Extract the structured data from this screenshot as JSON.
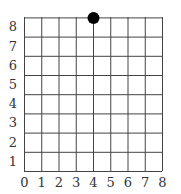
{
  "chart_data": {
    "type": "scatter",
    "title": "",
    "xlabel": "",
    "ylabel": "",
    "xlim": [
      0,
      8
    ],
    "ylim": [
      0,
      8
    ],
    "grid": true,
    "x_ticks": [
      "0",
      "1",
      "2",
      "3",
      "4",
      "5",
      "6",
      "7",
      "8"
    ],
    "y_ticks": [
      "1",
      "2",
      "3",
      "4",
      "5",
      "6",
      "7",
      "8"
    ],
    "points": [
      {
        "x": 4,
        "y": 8
      }
    ],
    "colors": {
      "grid": "#444444",
      "point": "#000000",
      "frame": "#888888"
    }
  }
}
